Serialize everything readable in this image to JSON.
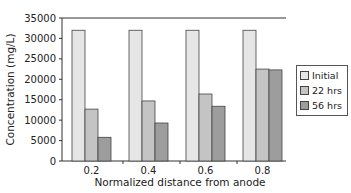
{
  "chart_data": {
    "type": "bar",
    "title": "",
    "xlabel": "Normalized distance from anode",
    "ylabel": "Concentration (mg/L)",
    "categories": [
      "0.2",
      "0.4",
      "0.6",
      "0.8"
    ],
    "series": [
      {
        "name": "Initial",
        "values": [
          32000,
          32000,
          32000,
          32000
        ],
        "color": "#e6e6e6"
      },
      {
        "name": "22 hrs",
        "values": [
          12700,
          14700,
          16400,
          22500
        ],
        "color": "#c4c4c4"
      },
      {
        "name": "56 hrs",
        "values": [
          5800,
          9300,
          13400,
          22300
        ],
        "color": "#9d9d9d"
      }
    ],
    "ylim": [
      0,
      35000
    ],
    "yticks": [
      0,
      5000,
      10000,
      15000,
      20000,
      25000,
      30000,
      35000
    ],
    "grid": false,
    "legend_position": "right"
  }
}
